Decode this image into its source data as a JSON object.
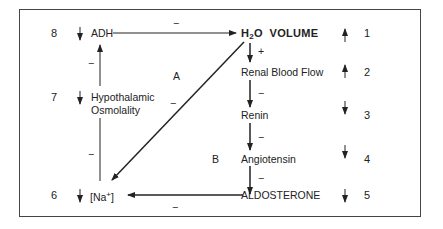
{
  "diagram": {
    "nodes": {
      "adh": "ADH",
      "h2o_volume_pre": "H",
      "h2o_volume_sub": "2",
      "h2o_volume_post": "O  VOLUME",
      "renal_blood_flow": "Renal Blood Flow",
      "renin": "Renin",
      "angiotensin": "Angiotensin",
      "aldosterone": "ALDOSTERONE",
      "hypothalamic_line1": "Hypothalamic",
      "hypothalamic_line2": "Osmolality",
      "na_pre": "[Na",
      "na_sup": "+",
      "na_post": "]"
    },
    "left_numbers": [
      "8",
      "7",
      "6"
    ],
    "left_arrows": [
      "↓",
      "↓",
      "↓"
    ],
    "right_numbers": [
      "1",
      "2",
      "3",
      "4",
      "5"
    ],
    "right_arrows": [
      "↑",
      "↑",
      "↓",
      "↓",
      "↓"
    ],
    "region_labels": {
      "a": "A",
      "b": "B"
    },
    "edge_signs": {
      "adh_to_h2o": "−",
      "h2o_to_rbf": "+",
      "rbf_to_renin": "−",
      "renin_to_angiotensin": "−",
      "angiotensin_to_aldosterone": "−",
      "aldosterone_to_na": "−",
      "h2o_to_na": "−",
      "na_to_hypo": "−",
      "hypo_to_adh": "−"
    }
  }
}
